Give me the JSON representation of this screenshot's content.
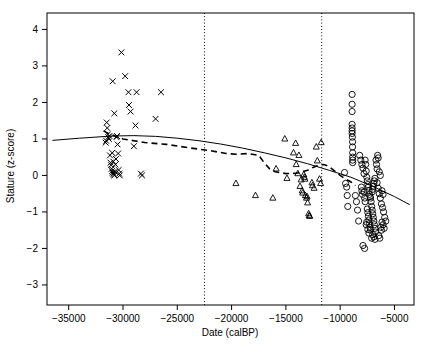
{
  "chart_data": {
    "type": "scatter",
    "title": "",
    "xlabel": "Date (calBP)",
    "ylabel": "Stature (z-score)",
    "xlim": [
      -37000,
      -3200
    ],
    "ylim": [
      -3.55,
      4.45
    ],
    "xticks": [
      -35000,
      -30000,
      -25000,
      -20000,
      -15000,
      -10000,
      -5000
    ],
    "xticklabels": [
      "-35000",
      "-30000",
      "-25000",
      "-20000",
      "-15000",
      "-10000",
      "-5000"
    ],
    "yticks": [
      4,
      3,
      2,
      1,
      0,
      -1,
      -2,
      -3
    ],
    "yticklabels": [
      "4",
      "3",
      "2",
      "1",
      "0",
      "-1",
      "-2",
      "-3"
    ],
    "grid": false,
    "legend": "none",
    "annotations": {
      "vertical_reference_lines": [
        {
          "name": "lgm-onset",
          "x": -22500
        },
        {
          "name": "pleistocene-holocene-boundary",
          "x": -11700
        }
      ]
    },
    "series": [
      {
        "name": "Upper Palaeolithic",
        "marker": "cross",
        "points": [
          [
            -31600,
            0.9
          ],
          [
            -31500,
            1.45
          ],
          [
            -31450,
            1.3
          ],
          [
            -31400,
            1.12
          ],
          [
            -31350,
            1.05
          ],
          [
            -31300,
            1.0
          ],
          [
            -31250,
            1.08
          ],
          [
            -31200,
            0.55
          ],
          [
            -31150,
            0.35
          ],
          [
            -31100,
            0.28
          ],
          [
            -31050,
            0.18
          ],
          [
            -31000,
            0.12
          ],
          [
            -30950,
            0.08
          ],
          [
            -30900,
            0.05
          ],
          [
            -30850,
            0.02
          ],
          [
            -30800,
            0.0
          ],
          [
            -30750,
            0.1
          ],
          [
            -30700,
            0.3
          ],
          [
            -30650,
            0.45
          ],
          [
            -30600,
            1.05
          ],
          [
            -30550,
            1.08
          ],
          [
            -30500,
            0.85
          ],
          [
            -30450,
            0.6
          ],
          [
            -30400,
            0.15
          ],
          [
            -30350,
            0.05
          ],
          [
            -30300,
            0.0
          ],
          [
            -30800,
            1.7
          ],
          [
            -30950,
            2.58
          ],
          [
            -30150,
            3.37
          ],
          [
            -29800,
            2.72
          ],
          [
            -29500,
            2.28
          ],
          [
            -29450,
            1.93
          ],
          [
            -29300,
            1.75
          ],
          [
            -29000,
            0.8
          ],
          [
            -28750,
            2.28
          ],
          [
            -28850,
            1.37
          ],
          [
            -28350,
            0.05
          ],
          [
            -28250,
            0.0
          ],
          [
            -26500,
            2.28
          ],
          [
            -27000,
            1.55
          ],
          [
            -31550,
            0.95
          ],
          [
            -31000,
            0.62
          ],
          [
            -30900,
            0.38
          ]
        ]
      },
      {
        "name": "Late Glacial",
        "marker": "triangle",
        "points": [
          [
            -19600,
            -0.22
          ],
          [
            -17800,
            -0.55
          ],
          [
            -16200,
            -0.62
          ],
          [
            -15900,
            0.18
          ],
          [
            -14900,
            -0.08
          ],
          [
            -14300,
            0.62
          ],
          [
            -14050,
            0.3
          ],
          [
            -13900,
            0.05
          ],
          [
            -13700,
            -0.3
          ],
          [
            -13600,
            -0.12
          ],
          [
            -13500,
            -0.42
          ],
          [
            -13450,
            -0.48
          ],
          [
            -13350,
            0.02
          ],
          [
            -13300,
            -0.05
          ],
          [
            -13250,
            -0.1
          ],
          [
            -13200,
            -0.55
          ],
          [
            -13100,
            -0.62
          ],
          [
            -13000,
            -0.75
          ],
          [
            -12900,
            -1.05
          ],
          [
            -12850,
            -1.1
          ],
          [
            -12800,
            -1.12
          ],
          [
            -12600,
            -0.2
          ],
          [
            -12550,
            -0.28
          ],
          [
            -12400,
            -0.35
          ],
          [
            -12200,
            0.78
          ],
          [
            -12100,
            0.4
          ],
          [
            -11900,
            -0.1
          ],
          [
            -11800,
            -0.22
          ],
          [
            -11750,
            0.9
          ],
          [
            -15100,
            1.0
          ],
          [
            -14100,
            0.88
          ],
          [
            -13800,
            0.55
          ],
          [
            -13050,
            -0.58
          ]
        ]
      },
      {
        "name": "Holocene",
        "marker": "circle",
        "points": [
          [
            -8900,
            2.22
          ],
          [
            -8900,
            1.95
          ],
          [
            -8900,
            1.75
          ],
          [
            -8900,
            1.4
          ],
          [
            -8900,
            1.3
          ],
          [
            -8900,
            1.22
          ],
          [
            -8900,
            1.15
          ],
          [
            -8880,
            1.05
          ],
          [
            -8860,
            0.92
          ],
          [
            -8860,
            0.78
          ],
          [
            -8850,
            0.62
          ],
          [
            -8850,
            0.5
          ],
          [
            -8850,
            0.42
          ],
          [
            -8850,
            0.35
          ],
          [
            -9600,
            0.08
          ],
          [
            -9500,
            -0.22
          ],
          [
            -9400,
            -0.32
          ],
          [
            -9350,
            -0.55
          ],
          [
            -9300,
            -0.85
          ],
          [
            -8200,
            0.55
          ],
          [
            -8100,
            0.42
          ],
          [
            -8000,
            0.3
          ],
          [
            -7900,
            0.2
          ],
          [
            -7800,
            0.05
          ],
          [
            -7700,
            0.42
          ],
          [
            -7650,
            0.3
          ],
          [
            -7600,
            0.12
          ],
          [
            -7550,
            -0.05
          ],
          [
            -7500,
            -0.15
          ],
          [
            -7450,
            -0.25
          ],
          [
            -7400,
            -0.32
          ],
          [
            -7350,
            -0.42
          ],
          [
            -7300,
            -0.52
          ],
          [
            -7250,
            -0.58
          ],
          [
            -7200,
            -0.62
          ],
          [
            -7150,
            -0.72
          ],
          [
            -7100,
            -0.85
          ],
          [
            -7050,
            -0.95
          ],
          [
            -7000,
            -1.05
          ],
          [
            -6950,
            -1.15
          ],
          [
            -6900,
            -1.25
          ],
          [
            -6850,
            -1.35
          ],
          [
            -6800,
            -1.45
          ],
          [
            -6750,
            -1.55
          ],
          [
            -7000,
            -1.62
          ],
          [
            -6900,
            -1.68
          ],
          [
            -6800,
            -1.75
          ],
          [
            -7100,
            -1.72
          ],
          [
            -7200,
            -1.5
          ],
          [
            -7250,
            -1.42
          ],
          [
            -7300,
            -1.32
          ],
          [
            -7350,
            -1.22
          ],
          [
            -7400,
            -1.12
          ],
          [
            -7450,
            -1.02
          ],
          [
            -7500,
            -0.92
          ],
          [
            -6600,
            -0.2
          ],
          [
            -6500,
            -0.35
          ],
          [
            -6400,
            -0.5
          ],
          [
            -6300,
            -0.62
          ],
          [
            -6200,
            -0.78
          ],
          [
            -6100,
            -0.88
          ],
          [
            -6000,
            -1.0
          ],
          [
            -5900,
            -1.15
          ],
          [
            -6700,
            0.42
          ],
          [
            -6650,
            0.3
          ],
          [
            -6600,
            0.18
          ],
          [
            -6400,
            0.1
          ],
          [
            -6300,
            0.0
          ],
          [
            -7800,
            -0.45
          ],
          [
            -7750,
            -0.62
          ],
          [
            -7700,
            -0.72
          ],
          [
            -8600,
            -0.55
          ],
          [
            -8500,
            -0.72
          ],
          [
            -8400,
            -0.95
          ],
          [
            -8300,
            -1.25
          ],
          [
            -7900,
            -1.92
          ],
          [
            -7750,
            -2.0
          ],
          [
            -6250,
            -1.42
          ],
          [
            -6200,
            -1.5
          ],
          [
            -6150,
            -1.28
          ],
          [
            -6050,
            -1.35
          ],
          [
            -5950,
            -1.45
          ],
          [
            -7050,
            -0.45
          ],
          [
            -7000,
            -0.38
          ],
          [
            -6950,
            -0.3
          ],
          [
            -6900,
            -0.22
          ],
          [
            -6850,
            -0.15
          ],
          [
            -6800,
            -0.08
          ],
          [
            -7600,
            -1.35
          ],
          [
            -7550,
            -1.28
          ],
          [
            -7450,
            -1.48
          ],
          [
            -7350,
            -1.58
          ],
          [
            -6450,
            -1.65
          ],
          [
            -6350,
            -1.72
          ],
          [
            -8050,
            -0.32
          ],
          [
            -8000,
            -0.42
          ],
          [
            -7950,
            -0.52
          ],
          [
            -6550,
            0.55
          ],
          [
            -6500,
            0.48
          ],
          [
            -6150,
            -0.42
          ],
          [
            -6050,
            -0.52
          ],
          [
            -5800,
            -1.25
          ]
        ]
      }
    ],
    "trend_lines": [
      {
        "name": "overall-regression",
        "style": "solid",
        "points": [
          [
            -36500,
            0.96
          ],
          [
            -34000,
            1.02
          ],
          [
            -31000,
            1.08
          ],
          [
            -29000,
            1.09
          ],
          [
            -27000,
            1.07
          ],
          [
            -25000,
            1.02
          ],
          [
            -23000,
            0.95
          ],
          [
            -21000,
            0.86
          ],
          [
            -19000,
            0.75
          ],
          [
            -17000,
            0.62
          ],
          [
            -15000,
            0.48
          ],
          [
            -13000,
            0.32
          ],
          [
            -11000,
            0.14
          ],
          [
            -9000,
            -0.05
          ],
          [
            -7000,
            -0.3
          ],
          [
            -5000,
            -0.58
          ],
          [
            -3600,
            -0.8
          ]
        ]
      },
      {
        "name": "loess-smoother",
        "style": "dashed",
        "points": [
          [
            -31800,
            1.22
          ],
          [
            -31000,
            1.1
          ],
          [
            -30000,
            1.0
          ],
          [
            -29000,
            0.95
          ],
          [
            -28000,
            0.9
          ],
          [
            -26000,
            0.85
          ],
          [
            -24000,
            0.76
          ],
          [
            -22000,
            0.68
          ],
          [
            -20500,
            0.6
          ],
          [
            -19500,
            0.58
          ],
          [
            -18500,
            0.6
          ],
          [
            -17500,
            0.55
          ],
          [
            -17000,
            0.35
          ],
          [
            -16500,
            0.18
          ],
          [
            -16000,
            0.1
          ],
          [
            -15000,
            0.05
          ],
          [
            -14000,
            0.06
          ],
          [
            -13000,
            0.14
          ],
          [
            -12500,
            0.22
          ],
          [
            -12000,
            0.28
          ],
          [
            -11500,
            0.3
          ],
          [
            -11000,
            0.24
          ],
          [
            -10500,
            0.12
          ],
          [
            -10000,
            0.0
          ],
          [
            -9500,
            -0.1
          ],
          [
            -9000,
            -0.18
          ],
          [
            -8600,
            -0.28
          ]
        ]
      }
    ]
  }
}
